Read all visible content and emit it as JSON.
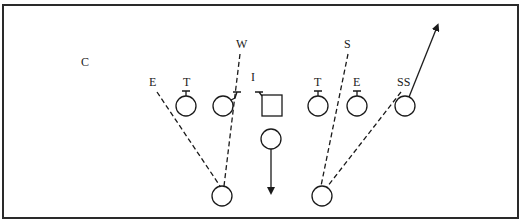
{
  "diagram": {
    "type": "football-play",
    "labels": {
      "c": "C",
      "w": "W",
      "s": "S",
      "e_left": "E",
      "t_left": "T",
      "i": "I",
      "t_right": "T",
      "e_right": "E",
      "ss": "SS"
    },
    "colors": {
      "line": "#1a1a1a",
      "background": "#ffffff",
      "border": "#2a2a2a"
    }
  }
}
